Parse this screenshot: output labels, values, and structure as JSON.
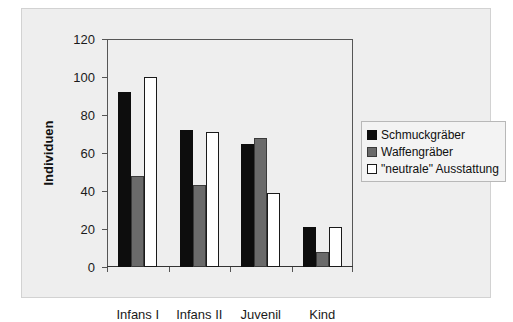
{
  "chart_data": {
    "type": "bar",
    "title": "",
    "subtitle": "",
    "xlabel": "",
    "ylabel": "Individuen",
    "categories": [
      "Infans I",
      "Infans II",
      "Juvenil",
      "Kind"
    ],
    "series": [
      {
        "name": "Schmuckgräber",
        "color": "#0d0d0d",
        "values": [
          92,
          72,
          65,
          21
        ]
      },
      {
        "name": "Waffengräber",
        "color": "#6a6a6a",
        "values": [
          48,
          43,
          68,
          8
        ]
      },
      {
        "name": "\"neutrale\" Ausstattung",
        "color": "#ffffff",
        "values": [
          100,
          71,
          39,
          21
        ]
      }
    ],
    "ylim": [
      0,
      120
    ],
    "ytick_values": [
      0,
      20,
      40,
      60,
      80,
      100,
      120
    ],
    "ytick_labels": [
      "0",
      "20",
      "40",
      "60",
      "80",
      "100",
      "120"
    ],
    "grid": false,
    "legend_position": "right",
    "bar_grouping": "grouped"
  },
  "legend": {
    "items": [
      {
        "label": "Schmuckgräber",
        "swatch": "black-square-swatch"
      },
      {
        "label": "Waffengräber",
        "swatch": "gray-square-swatch"
      },
      {
        "label": "\"neutrale\" Ausstattung",
        "swatch": "white-square-swatch"
      }
    ]
  },
  "axes": {
    "y_title": "Individuen"
  }
}
